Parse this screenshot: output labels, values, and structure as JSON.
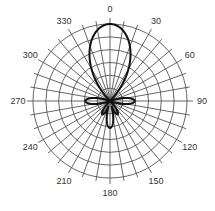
{
  "chart_data": {
    "type": "polar-line",
    "title": "",
    "angular_axis": {
      "direction": "clockwise",
      "zero_location": "top",
      "tick_labels": [
        "0",
        "30",
        "60",
        "90",
        "120",
        "150",
        "180",
        "210",
        "240",
        "270",
        "300",
        "330"
      ],
      "tick_values": [
        0,
        30,
        60,
        90,
        120,
        150,
        180,
        210,
        240,
        270,
        300,
        330
      ],
      "minor_spoke_step_deg": 10
    },
    "radial_axis": {
      "range": [
        0,
        1
      ],
      "rings": 6,
      "tick_labels_visible": false
    },
    "grid": true,
    "legend": null,
    "series": [
      {
        "name": "radiation pattern",
        "color": "#111111",
        "lobes": [
          {
            "direction_deg": 0,
            "magnitude": 1.0,
            "half_width_deg": 22
          },
          {
            "direction_deg": 90,
            "magnitude": 0.32,
            "half_width_deg": 10
          },
          {
            "direction_deg": 270,
            "magnitude": 0.32,
            "half_width_deg": 10
          },
          {
            "direction_deg": 180,
            "magnitude": 0.35,
            "half_width_deg": 10
          },
          {
            "direction_deg": 150,
            "magnitude": 0.2,
            "half_width_deg": 8
          },
          {
            "direction_deg": 210,
            "magnitude": 0.2,
            "half_width_deg": 8
          }
        ]
      }
    ]
  },
  "layout": {
    "center": [
      110,
      101
    ],
    "outer_radius": 77,
    "grid_color": "#555555",
    "line_color": "#111111"
  }
}
